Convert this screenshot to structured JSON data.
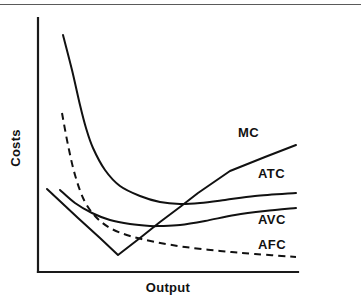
{
  "figure": {
    "background_color": "#ffffff",
    "line_color": "#111111",
    "axis_color": "#1a1a1a",
    "scan_rule_color": "#5a5a5a"
  },
  "chart_data": {
    "type": "line",
    "title": "",
    "xlabel": "Output",
    "ylabel": "Costs",
    "grid": false,
    "legend_position": "inline-right-of-curve-ends",
    "axis_ticks": {
      "x": [],
      "y": []
    },
    "axis_range_note": "Unlabeled qualitative axes; both axes start at origin with arrowless solid lines",
    "series": [
      {
        "name": "MC",
        "label": "MC",
        "style": "solid",
        "description": "Marginal cost: falls steeply from the left, reaches a minimum, then rises steeply and linearly, crossing AVC and then ATC at their minima",
        "points": [
          [
            47,
            189
          ],
          [
            78,
            218
          ],
          [
            100,
            238
          ],
          [
            118,
            255
          ],
          [
            140,
            238
          ],
          [
            160,
            222
          ],
          [
            180,
            207
          ],
          [
            198,
            193
          ],
          [
            230,
            171
          ],
          [
            265,
            157
          ],
          [
            296,
            145
          ]
        ],
        "label_position": [
          238,
          137
        ]
      },
      {
        "name": "ATC",
        "label": "ATC",
        "style": "solid",
        "description": "Average total cost: U-shaped, very high at low output, falling steeply then flattening to a shallow minimum before rising gently",
        "points": [
          [
            63,
            35
          ],
          [
            72,
            70
          ],
          [
            80,
            105
          ],
          [
            86,
            128
          ],
          [
            93,
            148
          ],
          [
            105,
            170
          ],
          [
            120,
            186
          ],
          [
            140,
            196
          ],
          [
            160,
            202
          ],
          [
            180,
            204
          ],
          [
            200,
            203
          ],
          [
            225,
            200
          ],
          [
            255,
            196
          ],
          [
            296,
            193
          ]
        ],
        "label_position": [
          258,
          178
        ]
      },
      {
        "name": "AVC",
        "label": "AVC",
        "style": "solid",
        "description": "Average variable cost: U-shaped, starts moderately high, declines to a minimum near the MC crossing, then rises gently toward ATC",
        "points": [
          [
            60,
            190
          ],
          [
            75,
            203
          ],
          [
            92,
            213
          ],
          [
            110,
            220
          ],
          [
            130,
            224
          ],
          [
            150,
            226
          ],
          [
            160,
            226
          ],
          [
            180,
            225
          ],
          [
            205,
            221
          ],
          [
            235,
            215
          ],
          [
            265,
            211
          ],
          [
            296,
            208
          ]
        ],
        "label_position": [
          258,
          224
        ]
      },
      {
        "name": "AFC",
        "label": "AFC",
        "style": "dashed",
        "description": "Average fixed cost: continuously declining hyperbola, never rising, approaching the horizontal axis asymptotically",
        "points": [
          [
            62,
            113
          ],
          [
            68,
            145
          ],
          [
            75,
            175
          ],
          [
            84,
            200
          ],
          [
            95,
            216
          ],
          [
            110,
            228
          ],
          [
            130,
            236
          ],
          [
            155,
            242
          ],
          [
            185,
            247
          ],
          [
            220,
            251
          ],
          [
            255,
            254
          ],
          [
            296,
            257
          ]
        ],
        "label_position": [
          258,
          249
        ]
      }
    ],
    "intersections": [
      {
        "curves": [
          "MC",
          "AVC"
        ],
        "approx_point": [
          160,
          224
        ],
        "note": "MC passes through AVC minimum"
      },
      {
        "curves": [
          "MC",
          "ATC"
        ],
        "approx_point": [
          198,
          200
        ],
        "note": "MC passes through ATC minimum"
      }
    ],
    "axes": {
      "y_axis": {
        "x": 38,
        "y_top": 18,
        "y_bottom": 272
      },
      "x_axis": {
        "y": 272,
        "x_left": 38,
        "x_right": 298
      }
    }
  },
  "labels": {
    "y_axis_title": "Costs",
    "x_axis_title": "Output",
    "mc": "MC",
    "atc": "ATC",
    "avc": "AVC",
    "afc": "AFC"
  }
}
